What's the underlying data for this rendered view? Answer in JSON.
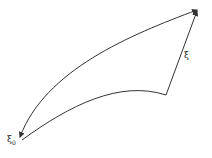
{
  "diagram": {
    "labels": {
      "start": "ξ",
      "start_sub": "0",
      "side": "ξ"
    },
    "stroke_color": "#333333",
    "background": "#ffffff"
  }
}
